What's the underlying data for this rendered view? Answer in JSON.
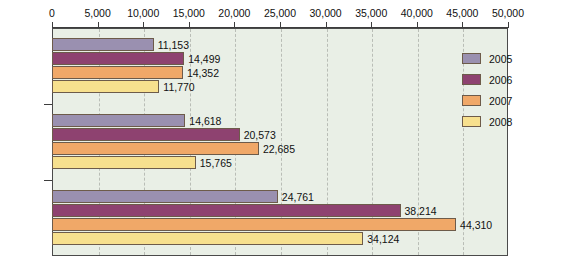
{
  "chart_data": {
    "type": "bar",
    "orientation": "horizontal",
    "title": "",
    "xlabel": "",
    "ylabel": "",
    "categories": [
      "Attacks",
      "Deaths",
      "Injuries"
    ],
    "series": [
      {
        "name": "2005",
        "color": "#9a90b0",
        "values": [
          11153,
          14618,
          24761
        ]
      },
      {
        "name": "2006",
        "color": "#8e4270",
        "values": [
          14499,
          20573,
          38214
        ]
      },
      {
        "name": "2007",
        "color": "#f0a868",
        "values": [
          14352,
          22685,
          44310
        ]
      },
      {
        "name": "2008",
        "color": "#f7e08e",
        "values": [
          11770,
          15765,
          34124
        ]
      }
    ],
    "value_labels": {
      "Attacks": [
        "11,153",
        "14,499",
        "14,352",
        "11,770"
      ],
      "Deaths": [
        "14,618",
        "20,573",
        "22,685",
        "15,765"
      ],
      "Injuries": [
        "24,761",
        "38,214",
        "44,310",
        "34,124"
      ]
    },
    "xlim": [
      0,
      50000
    ],
    "xticks": [
      0,
      5000,
      10000,
      15000,
      20000,
      25000,
      30000,
      35000,
      40000,
      45000,
      50000
    ],
    "xtick_labels": [
      "0",
      "5,000",
      "10,000",
      "15,000",
      "20,000",
      "25,000",
      "30,000",
      "35,000",
      "40,000",
      "45,000",
      "50,000"
    ],
    "grid": true,
    "grid_style": "dashed-vertical",
    "legend_position": "top-right",
    "axis_position": "top",
    "plot_background": "#e9efe6"
  },
  "legend": {
    "entries": [
      {
        "label": "2005"
      },
      {
        "label": "2006"
      },
      {
        "label": "2007"
      },
      {
        "label": "2008"
      }
    ]
  }
}
